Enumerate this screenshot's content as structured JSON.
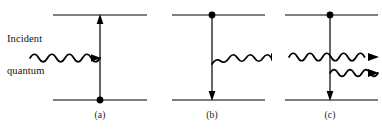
{
  "figure": {
    "width": 382,
    "height": 134,
    "background_color": "#ffffff",
    "stroke_color": "#000000"
  },
  "annotations": {
    "incident_label_line1": "Incident",
    "incident_label_line2": "quantum"
  },
  "panels": [
    {
      "id": "a",
      "caption": "(a)",
      "process": "absorption",
      "upper_level_y": 15,
      "lower_level_y": 100,
      "level_x_start": 53,
      "level_x_end": 147,
      "vertical_x": 100,
      "transition_direction": "up",
      "dot_position": "lower",
      "waves": [
        {
          "name": "incident-wave",
          "x_start": 30,
          "x_end": 100,
          "y": 58,
          "cycles": 4,
          "amplitude": 6,
          "arrow": "right",
          "direction": "into-atom"
        }
      ]
    },
    {
      "id": "b",
      "caption": "(b)",
      "process": "spontaneous-emission",
      "upper_level_y": 15,
      "lower_level_y": 100,
      "level_x_start": 172,
      "level_x_end": 265,
      "vertical_x": 212,
      "transition_direction": "down",
      "dot_position": "upper",
      "waves": [
        {
          "name": "emitted-wave",
          "x_start": 212,
          "x_end": 280,
          "y": 58,
          "cycles": 4,
          "amplitude": 6,
          "arrow": "right",
          "direction": "out-of-atom"
        }
      ]
    },
    {
      "id": "c",
      "caption": "(c)",
      "process": "stimulated-emission",
      "upper_level_y": 15,
      "lower_level_y": 100,
      "level_x_start": 285,
      "level_x_end": 378,
      "vertical_x": 330,
      "transition_direction": "down",
      "dot_position": "upper",
      "waves": [
        {
          "name": "stimulating-wave",
          "x_start": 289,
          "x_end": 376,
          "y": 57,
          "cycles": 5,
          "amplitude": 6,
          "arrow": "right",
          "direction": "through-atom"
        },
        {
          "name": "stimulated-wave",
          "x_start": 330,
          "x_end": 376,
          "y": 73,
          "cycles": 3,
          "amplitude": 5,
          "arrow": "right",
          "direction": "out-of-atom"
        }
      ]
    }
  ]
}
